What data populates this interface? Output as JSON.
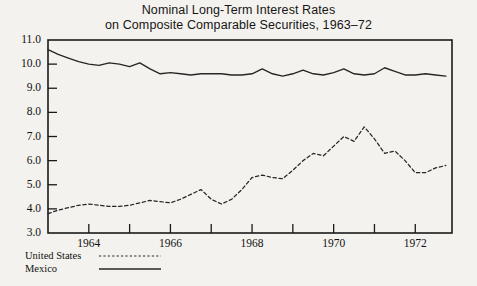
{
  "figure": {
    "title_line1": "Nominal Long-Term Interest Rates",
    "title_line2": "on Composite Comparable Securities, 1963–72",
    "background_color": "#f4f2ee",
    "ink_color": "#1a1a1a"
  },
  "legend": {
    "position": "below-axis-left",
    "entries": [
      {
        "label": "United States",
        "style": "dotted"
      },
      {
        "label": "Mexico",
        "style": "solid"
      }
    ]
  },
  "chart_data": {
    "type": "line",
    "title": "Nominal Long-Term Interest Rates on Composite Comparable Securities, 1963–72",
    "xlabel": "",
    "ylabel": "",
    "xlim": [
      1963.0,
      1972.9
    ],
    "ylim": [
      3.0,
      11.0
    ],
    "grid": false,
    "legend_position": "below-left",
    "ytick_labels": [
      "11.0",
      "10.0",
      "9.0",
      "8.0",
      "7.0",
      "6.0",
      "5.0",
      "4.0",
      "3.0"
    ],
    "ytick_values": [
      11.0,
      10.0,
      9.0,
      8.0,
      7.0,
      6.0,
      5.0,
      4.0,
      3.0
    ],
    "xtick_values": [
      1963,
      1964,
      1965,
      1966,
      1967,
      1968,
      1969,
      1970,
      1971,
      1972
    ],
    "xtick_labels": [
      "",
      "1964",
      "",
      "1966",
      "",
      "1968",
      "",
      "1970",
      "",
      "1972"
    ],
    "x": [
      1963.0,
      1963.25,
      1963.5,
      1963.75,
      1964.0,
      1964.25,
      1964.5,
      1964.75,
      1965.0,
      1965.25,
      1965.5,
      1965.75,
      1966.0,
      1966.25,
      1966.5,
      1966.75,
      1967.0,
      1967.25,
      1967.5,
      1967.75,
      1968.0,
      1968.25,
      1968.5,
      1968.75,
      1969.0,
      1969.25,
      1969.5,
      1969.75,
      1970.0,
      1970.25,
      1970.5,
      1970.75,
      1971.0,
      1971.25,
      1971.5,
      1971.75,
      1972.0,
      1972.25,
      1972.5,
      1972.75
    ],
    "series": [
      {
        "name": "Mexico",
        "style": "solid",
        "color": "#262626",
        "values": [
          10.6,
          10.4,
          10.25,
          10.1,
          10.0,
          9.95,
          10.05,
          10.0,
          9.9,
          10.05,
          9.8,
          9.6,
          9.65,
          9.6,
          9.55,
          9.6,
          9.6,
          9.6,
          9.55,
          9.55,
          9.6,
          9.8,
          9.6,
          9.5,
          9.6,
          9.75,
          9.6,
          9.55,
          9.65,
          9.8,
          9.6,
          9.55,
          9.6,
          9.85,
          9.7,
          9.55,
          9.55,
          9.6,
          9.55,
          9.5
        ]
      },
      {
        "name": "United States",
        "style": "dotted",
        "color": "#262626",
        "values": [
          3.8,
          3.95,
          4.05,
          4.15,
          4.2,
          4.15,
          4.1,
          4.1,
          4.15,
          4.25,
          4.35,
          4.3,
          4.25,
          4.4,
          4.6,
          4.8,
          4.4,
          4.2,
          4.4,
          4.8,
          5.3,
          5.4,
          5.3,
          5.25,
          5.6,
          6.0,
          6.3,
          6.2,
          6.6,
          7.0,
          6.8,
          7.4,
          6.9,
          6.3,
          6.4,
          6.0,
          5.5,
          5.5,
          5.7,
          5.8
        ]
      }
    ]
  }
}
